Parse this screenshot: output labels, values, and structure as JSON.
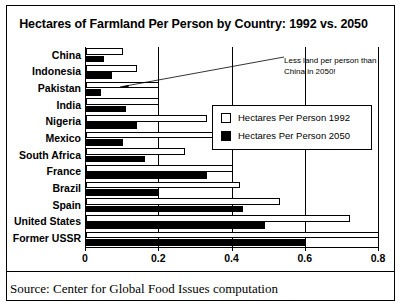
{
  "chart_data": {
    "type": "bar",
    "orientation": "horizontal",
    "title": "Hectares of Farmland Per Person by Country: 1992 vs. 2050",
    "xlabel": "",
    "ylabel": "",
    "xlim": [
      0,
      0.8
    ],
    "xticks": [
      "0",
      "0.2",
      "0.4",
      "0.6",
      "0.8"
    ],
    "xtick_values": [
      0,
      0.2,
      0.4,
      0.6,
      0.8
    ],
    "grid": true,
    "legend_position": "upper right",
    "categories": [
      "China",
      "Indonesia",
      "Pakistan",
      "India",
      "Nigeria",
      "Mexico",
      "South Africa",
      "France",
      "Brazil",
      "Spain",
      "United States",
      "Former USSR"
    ],
    "series": [
      {
        "name": "Hectares Per Person 1992",
        "color": "#ffffff",
        "values": [
          0.1,
          0.14,
          0.2,
          0.2,
          0.33,
          0.35,
          0.27,
          0.4,
          0.42,
          0.53,
          0.72,
          0.8
        ]
      },
      {
        "name": "Hectares Per Person 2050",
        "color": "#000000",
        "values": [
          0.05,
          0.07,
          0.04,
          0.11,
          0.14,
          0.1,
          0.16,
          0.33,
          0.2,
          0.43,
          0.49,
          0.6
        ]
      }
    ],
    "annotations": [
      {
        "text": "Less land per person than China in 2050!",
        "target_category": "Pakistan",
        "target_series": "Hectares Per Person 2050"
      }
    ]
  },
  "legend": {
    "items": [
      {
        "label": "Hectares Per Person 1992",
        "swatch": "white-square"
      },
      {
        "label": "Hectares Per Person 2050",
        "swatch": "black-square"
      }
    ]
  },
  "footer": {
    "source": "Source: Center for Global Food Issues computation"
  }
}
